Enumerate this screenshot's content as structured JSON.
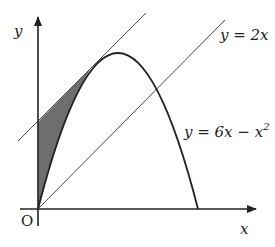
{
  "diagram": {
    "axes": {
      "x_label": "x",
      "y_label": "y",
      "origin_label": "O"
    },
    "curves": [
      {
        "id": "parabola",
        "equation_lhs": "y = 6x − x",
        "exponent": "2"
      },
      {
        "id": "line",
        "equation": "y = 2x"
      },
      {
        "id": "tangent",
        "description": "tangent to parabola, parallel to y = 2x"
      }
    ],
    "shaded_region": "region bounded by y-axis, tangent line and parabola",
    "colors": {
      "stroke": "#222222",
      "shade": "#6e6e6e",
      "background": "#ffffff"
    }
  }
}
